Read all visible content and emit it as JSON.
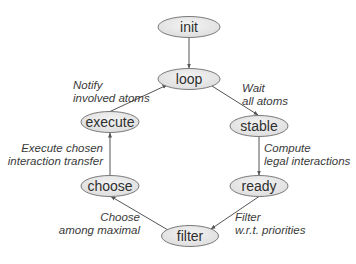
{
  "diagram": {
    "colors": {
      "node_fill": "#e6e6e6",
      "node_fill_light": "#f4f4f4",
      "node_stroke": "#7a7a7a",
      "edge_stroke": "#555555",
      "text": "#2e2e2e"
    },
    "nodes": [
      {
        "id": "init",
        "label": "init",
        "cx": 189,
        "cy": 27,
        "rx": 31,
        "ry": 10.5
      },
      {
        "id": "loop",
        "label": "loop",
        "cx": 189,
        "cy": 79,
        "rx": 31,
        "ry": 10.5
      },
      {
        "id": "stable",
        "label": "stable",
        "cx": 259,
        "cy": 126,
        "rx": 29,
        "ry": 10.5
      },
      {
        "id": "ready",
        "label": "ready",
        "cx": 259,
        "cy": 186,
        "rx": 29,
        "ry": 10.5
      },
      {
        "id": "filter",
        "label": "filter",
        "cx": 190,
        "cy": 236,
        "rx": 28.5,
        "ry": 10.5
      },
      {
        "id": "choose",
        "label": "choose",
        "cx": 110,
        "cy": 186,
        "rx": 29,
        "ry": 10.5
      },
      {
        "id": "execute",
        "label": "execute",
        "cx": 110,
        "cy": 122,
        "rx": 29,
        "ry": 10.5
      }
    ],
    "edges": [
      {
        "from": "init",
        "to": "loop",
        "x1": 189,
        "y1": 37.5,
        "x2": 189,
        "y2": 68,
        "label_lines": []
      },
      {
        "from": "loop",
        "to": "stable",
        "x1": 212,
        "y1": 86,
        "x2": 258,
        "y2": 115,
        "label_lines": [
          "Wait",
          "all atoms"
        ],
        "label_x": 242,
        "label_y": 92,
        "anchor": "start"
      },
      {
        "from": "stable",
        "to": "ready",
        "x1": 259,
        "y1": 137,
        "x2": 259,
        "y2": 175,
        "label_lines": [
          "Compute",
          "legal interactions"
        ],
        "label_x": 264,
        "label_y": 152,
        "anchor": "start"
      },
      {
        "from": "ready",
        "to": "filter",
        "x1": 259,
        "y1": 196.5,
        "x2": 211,
        "y2": 229,
        "label_lines": [
          "Filter",
          "w.r.t. priorities"
        ],
        "label_x": 235,
        "label_y": 221,
        "anchor": "start"
      },
      {
        "from": "filter",
        "to": "choose",
        "x1": 168,
        "y1": 230,
        "x2": 111,
        "y2": 196.5,
        "label_lines": [
          "Choose",
          "among maximal"
        ],
        "label_x": 140,
        "label_y": 221,
        "anchor": "end"
      },
      {
        "from": "choose",
        "to": "execute",
        "x1": 110,
        "y1": 175.5,
        "x2": 110,
        "y2": 133,
        "label_lines": [
          "Execute chosen",
          "interaction transfer"
        ],
        "label_x": 103,
        "label_y": 152,
        "anchor": "end"
      },
      {
        "from": "execute",
        "to": "loop",
        "x1": 110,
        "y1": 111.5,
        "x2": 167,
        "y2": 85,
        "label_lines": [
          "Notify",
          "involved atoms"
        ],
        "label_x": 73,
        "label_y": 89,
        "anchor": "start"
      }
    ]
  }
}
